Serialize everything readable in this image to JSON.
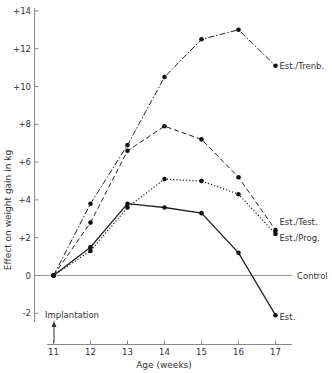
{
  "chart_data": {
    "type": "line",
    "title": "",
    "xlabel": "Age (weeks)",
    "ylabel": "Effect on weight gain in kg",
    "x": [
      11,
      12,
      13,
      14,
      15,
      16,
      17
    ],
    "xlim": [
      11,
      17
    ],
    "ylim": [
      -2,
      14
    ],
    "x_ticks": [
      "11",
      "12",
      "13",
      "14",
      "15",
      "16",
      "17"
    ],
    "y_ticks": [
      "-2",
      "0",
      "+2",
      "+4",
      "+6",
      "+8",
      "+10",
      "+12",
      "+14"
    ],
    "grid": false,
    "legend": "inline labels at line ends",
    "series": [
      {
        "name": "Est./Trenb.",
        "style": "dash-dot",
        "values": [
          0,
          3.8,
          6.9,
          10.5,
          12.5,
          13.0,
          11.1
        ]
      },
      {
        "name": "Est./Test.",
        "style": "dashed",
        "values": [
          0,
          2.8,
          6.6,
          7.9,
          7.2,
          5.2,
          2.4
        ]
      },
      {
        "name": "Est./Prog.",
        "style": "dotted",
        "values": [
          0,
          1.3,
          3.6,
          5.1,
          5.0,
          4.3,
          2.2
        ]
      },
      {
        "name": "Est.",
        "style": "solid",
        "values": [
          0,
          1.5,
          3.8,
          3.6,
          3.3,
          1.2,
          -2.1
        ]
      }
    ],
    "annotations": [
      {
        "text": "Control",
        "type": "horizontal-line",
        "y": 0
      },
      {
        "text": "Implantation",
        "type": "arrow",
        "x": 11
      }
    ]
  }
}
